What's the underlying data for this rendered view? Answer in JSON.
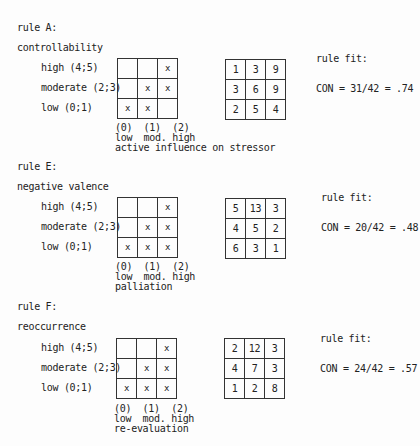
{
  "rules": [
    {
      "title": "rule A:",
      "variable": "controllability",
      "row_labels": [
        "high (4;5)",
        "moderate (2;3)",
        "low (0;1)"
      ],
      "pattern": [
        [
          "",
          "",
          "x"
        ],
        [
          "",
          "x",
          "x"
        ],
        [
          "x",
          "x",
          ""
        ]
      ],
      "counts": [
        [
          "1",
          "3",
          "9"
        ],
        [
          "3",
          "6",
          "9"
        ],
        [
          "2",
          "5",
          "4"
        ]
      ],
      "axis_codes": "(0)  (1)  (2)",
      "axis_levels": "low  mod. high",
      "axis_label": "active influence on stressor",
      "fit_label": "rule fit:",
      "fit_value": "CON = 31/42 = .74"
    },
    {
      "title": "rule E:",
      "variable": "negative valence",
      "row_labels": [
        "high (4;5)",
        "moderate (2;3)",
        "low (0;1)"
      ],
      "pattern": [
        [
          "",
          "",
          "x"
        ],
        [
          "",
          "x",
          "x"
        ],
        [
          "x",
          "x",
          "x"
        ]
      ],
      "counts": [
        [
          "5",
          "13",
          "3"
        ],
        [
          "4",
          "5",
          "2"
        ],
        [
          "6",
          "3",
          "1"
        ]
      ],
      "axis_codes": "(0)  (1)  (2)",
      "axis_levels": "low  mod. high",
      "axis_label": "palliation",
      "fit_label": "rule fit:",
      "fit_value": "CON = 20/42 = .48"
    },
    {
      "title": "rule F:",
      "variable": "reoccurrence",
      "row_labels": [
        "high (4;5)",
        "moderate (2;3)",
        "low (0;1)"
      ],
      "pattern": [
        [
          "",
          "",
          "x"
        ],
        [
          "",
          "x",
          "x"
        ],
        [
          "x",
          "x",
          "x"
        ]
      ],
      "counts": [
        [
          "2",
          "12",
          "3"
        ],
        [
          "4",
          "7",
          "3"
        ],
        [
          "1",
          "2",
          "8"
        ]
      ],
      "axis_codes": "(0)  (1)  (2)",
      "axis_levels": "low  mod. high",
      "axis_label": "re-evaluation",
      "fit_label": "rule fit:",
      "fit_value": "CON = 24/42 = .57"
    }
  ]
}
